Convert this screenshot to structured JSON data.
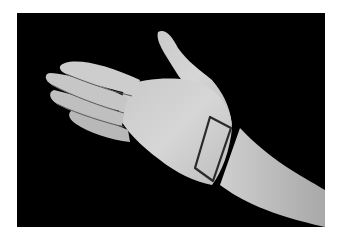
{
  "image": {
    "description": "Black and white photograph of an open right hand, palm up, against a black background, with a rectangular outline drawn in dark marker over the base of the palm near the wrist",
    "subject": "hand with marked rectangle on palm/wrist",
    "colors": {
      "page_background": "#ffffff",
      "photo_background": "#000000",
      "skin_light": "#d4d4d4",
      "skin_mid": "#b0b0b0",
      "skin_shadow": "#7a7a7a",
      "marker_outline": "#2a2a2a"
    }
  }
}
